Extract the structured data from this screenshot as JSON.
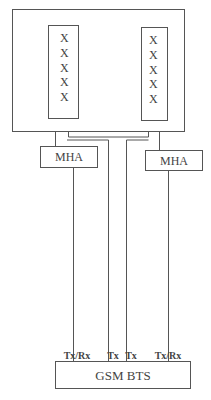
{
  "diagram": {
    "antenna_panels": [
      {
        "name": "left",
        "elements": [
          "X",
          "X",
          "X",
          "X",
          "X"
        ]
      },
      {
        "name": "right",
        "elements": [
          "X",
          "X",
          "X",
          "X",
          "X"
        ]
      }
    ],
    "mha_left": "MHA",
    "mha_right": "MHA",
    "ports": [
      "Tx/Rx",
      "Tx",
      "Tx",
      "Tx/Rx"
    ],
    "bts_label": "GSM BTS"
  }
}
